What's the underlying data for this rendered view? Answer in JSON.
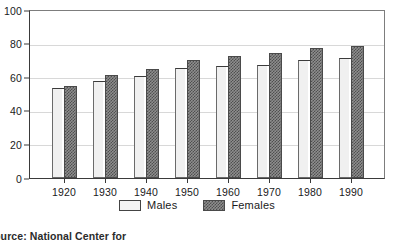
{
  "chart_data": {
    "type": "bar",
    "title": "",
    "xlabel": "",
    "ylabel": "",
    "ylim": [
      0,
      100
    ],
    "yticks": [
      0,
      20,
      40,
      60,
      80,
      100
    ],
    "grid": true,
    "legend_position": "bottom-center",
    "categories": [
      "1920",
      "1930",
      "1940",
      "1950",
      "1960",
      "1970",
      "1980",
      "1990"
    ],
    "series": [
      {
        "name": "Males",
        "color": "#f0f0f0",
        "values": [
          53.5,
          58,
          61,
          65.5,
          66.5,
          67,
          70,
          71.5
        ]
      },
      {
        "name": "Females",
        "color": "#6f6f6f",
        "values": [
          54.5,
          61.5,
          65,
          70,
          72.5,
          74.5,
          77.5,
          78.5
        ]
      }
    ],
    "annotations": []
  },
  "legend": {
    "items": [
      {
        "label": "Males",
        "swatch": "light-swatch"
      },
      {
        "label": "Females",
        "swatch": "dark-checkered-swatch"
      }
    ]
  },
  "footer": {
    "source_note": "Source: National Center for"
  }
}
